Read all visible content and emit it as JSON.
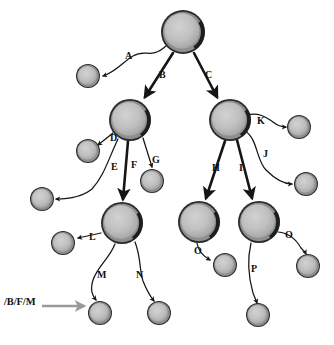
{
  "diagram": {
    "background_color": "#ffffff",
    "node_fill_color": "#b4b4b4",
    "node_inner_color": "#c2c2c2",
    "node_ring_color": "#1a1a1a",
    "edge_color": "#151515",
    "annotation_arrow_color": "#9a9a9a"
  },
  "nodes": [
    {
      "id": "root",
      "name": "root-node",
      "cx": 183,
      "cy": 32,
      "r": 22,
      "type": "internal"
    },
    {
      "id": "a_leaf",
      "name": "leaf-node-a",
      "cx": 88,
      "cy": 76,
      "r": 12,
      "type": "leaf"
    },
    {
      "id": "b",
      "name": "internal-node-b",
      "cx": 130,
      "cy": 120,
      "r": 21,
      "type": "internal"
    },
    {
      "id": "c",
      "name": "internal-node-c",
      "cx": 230,
      "cy": 120,
      "r": 21,
      "type": "internal"
    },
    {
      "id": "d_leaf",
      "name": "leaf-node-d",
      "cx": 88,
      "cy": 151,
      "r": 12,
      "type": "leaf"
    },
    {
      "id": "e_leaf",
      "name": "leaf-node-e",
      "cx": 42,
      "cy": 199,
      "r": 12,
      "type": "leaf"
    },
    {
      "id": "g_leaf",
      "name": "leaf-node-g",
      "cx": 152,
      "cy": 181,
      "r": 12,
      "type": "leaf"
    },
    {
      "id": "f",
      "name": "internal-node-f",
      "cx": 122,
      "cy": 223,
      "r": 21,
      "type": "internal"
    },
    {
      "id": "k_leaf",
      "name": "leaf-node-k",
      "cx": 299,
      "cy": 127,
      "r": 12,
      "type": "leaf"
    },
    {
      "id": "j_leaf",
      "name": "leaf-node-j",
      "cx": 306,
      "cy": 184,
      "r": 12,
      "type": "leaf"
    },
    {
      "id": "h",
      "name": "internal-node-h",
      "cx": 199,
      "cy": 222,
      "r": 21,
      "type": "internal"
    },
    {
      "id": "i",
      "name": "internal-node-i",
      "cx": 259,
      "cy": 222,
      "r": 21,
      "type": "internal"
    },
    {
      "id": "l_leaf",
      "name": "leaf-node-l",
      "cx": 63,
      "cy": 243,
      "r": 12,
      "type": "leaf"
    },
    {
      "id": "m_leaf",
      "name": "leaf-node-m",
      "cx": 100,
      "cy": 313,
      "r": 12,
      "type": "leaf"
    },
    {
      "id": "n_leaf",
      "name": "leaf-node-n",
      "cx": 159,
      "cy": 313,
      "r": 12,
      "type": "leaf"
    },
    {
      "id": "o1_leaf",
      "name": "leaf-node-o-left",
      "cx": 225,
      "cy": 265,
      "r": 12,
      "type": "leaf"
    },
    {
      "id": "p_leaf",
      "name": "leaf-node-p",
      "cx": 258,
      "cy": 315,
      "r": 12,
      "type": "leaf"
    },
    {
      "id": "o2_leaf",
      "name": "leaf-node-o-right",
      "cx": 308,
      "cy": 266,
      "r": 12,
      "type": "leaf"
    }
  ],
  "edges": [
    {
      "id": "A",
      "label": "A",
      "from": "root",
      "to": "a_leaf",
      "label_x": 125,
      "label_y": 51,
      "style": "thin",
      "d": "M 166 46 C 150 60 146 48 133 56 C 124 61 116 72 103 76"
    },
    {
      "id": "B",
      "label": "B",
      "from": "root",
      "to": "b",
      "label_x": 159,
      "label_y": 70,
      "style": "thick",
      "d": "M 173 53 L 145 97"
    },
    {
      "id": "C",
      "label": "C",
      "from": "root",
      "to": "c",
      "label_x": 205,
      "label_y": 70,
      "style": "thick",
      "d": "M 194 53 L 217 97"
    },
    {
      "id": "D",
      "label": "D",
      "from": "b",
      "to": "d_leaf",
      "label_x": 110,
      "label_y": 133,
      "style": "thin",
      "d": "M 113 133 L 98 145"
    },
    {
      "id": "E",
      "label": "E",
      "from": "b",
      "to": "e_leaf",
      "label_x": 111,
      "label_y": 162,
      "style": "thin",
      "d": "M 118 139 C 108 160 104 176 92 189 C 82 197 70 199 56 199"
    },
    {
      "id": "F",
      "label": "F",
      "from": "b",
      "to": "f",
      "label_x": 131,
      "label_y": 160,
      "style": "thick",
      "d": "M 128 141 L 123 199"
    },
    {
      "id": "G",
      "label": "G",
      "from": "b",
      "to": "g_leaf",
      "label_x": 152,
      "label_y": 155,
      "style": "thin",
      "d": "M 143 138 L 152 167"
    },
    {
      "id": "H",
      "label": "H",
      "from": "c",
      "to": "h",
      "label_x": 212,
      "label_y": 163,
      "style": "thick",
      "d": "M 225 141 L 206 198"
    },
    {
      "id": "I",
      "label": "I",
      "from": "c",
      "to": "i",
      "label_x": 239,
      "label_y": 163,
      "style": "thick",
      "d": "M 237 140 L 252 198"
    },
    {
      "id": "J",
      "label": "J",
      "from": "c",
      "to": "j_leaf",
      "label_x": 263,
      "label_y": 149,
      "style": "thin",
      "d": "M 245 131 C 258 139 256 160 266 170 C 276 180 284 184 292 184"
    },
    {
      "id": "K",
      "label": "K",
      "from": "c",
      "to": "k_leaf",
      "label_x": 257,
      "label_y": 116,
      "style": "thin",
      "d": "M 247 115 C 258 112 266 117 273 122 C 278 126 282 127 286 127"
    },
    {
      "id": "L",
      "label": "L",
      "from": "f",
      "to": "l_leaf",
      "label_x": 89,
      "label_y": 232,
      "style": "thin",
      "d": "M 101 233 L 78 238"
    },
    {
      "id": "M",
      "label": "M",
      "from": "f",
      "to": "m_leaf",
      "label_x": 97,
      "label_y": 270,
      "style": "thin",
      "d": "M 115 244 C 109 259 98 266 93 280 C 90 290 92 295 96 300"
    },
    {
      "id": "N",
      "label": "N",
      "from": "f",
      "to": "n_leaf",
      "label_x": 136,
      "label_y": 270,
      "style": "thin",
      "d": "M 135 242 C 141 257 139 268 143 281 C 147 291 150 296 154 301"
    },
    {
      "id": "O1",
      "label": "O",
      "from": "h",
      "to": "o1_leaf",
      "label_x": 194,
      "label_y": 246,
      "style": "thin",
      "d": "M 197 243 C 198 251 203 256 210 260"
    },
    {
      "id": "P",
      "label": "P",
      "from": "i",
      "to": "p_leaf",
      "label_x": 251,
      "label_y": 264,
      "style": "thin",
      "d": "M 251 243 C 247 260 249 279 253 293 C 255 298 256 300 257 303"
    },
    {
      "id": "O2",
      "label": "O",
      "from": "i",
      "to": "o2_leaf",
      "label_x": 285,
      "label_y": 230,
      "style": "thin",
      "d": "M 278 232 C 288 233 296 239 301 248 C 304 251 305 252 306 254"
    }
  ],
  "annotation": {
    "name": "path-annotation",
    "text": "/B/F/M",
    "x": 4,
    "y": 296,
    "target_node": "m_leaf",
    "arrow": {
      "x1": 42,
      "y1": 306,
      "x2": 84,
      "y2": 306
    }
  }
}
